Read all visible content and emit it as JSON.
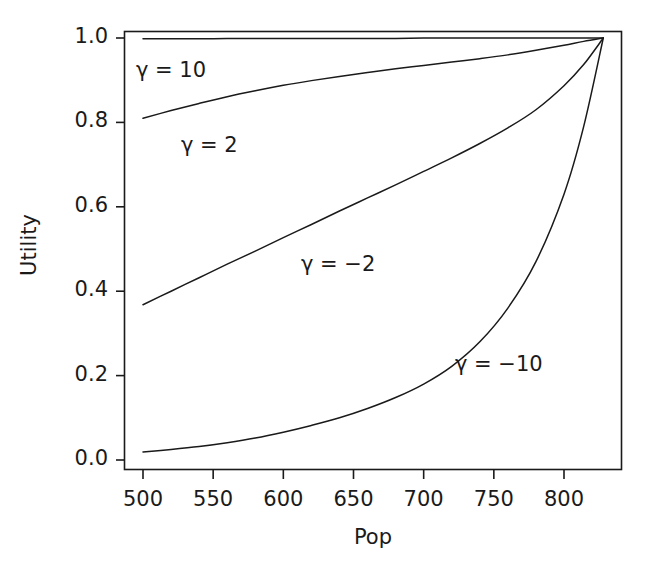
{
  "chart_data": {
    "type": "line",
    "title": "",
    "xlabel": "Pop",
    "ylabel": "Utility",
    "xlim": [
      500,
      828
    ],
    "ylim": [
      0.0,
      1.02
    ],
    "grid": false,
    "legend_position": "inline-annotations",
    "xticks": [
      500,
      550,
      600,
      650,
      700,
      750,
      800
    ],
    "xtick_labels": [
      "500",
      "550",
      "600",
      "650",
      "700",
      "750",
      "800"
    ],
    "yticks": [
      0.0,
      0.2,
      0.4,
      0.6,
      0.8,
      1.0
    ],
    "ytick_labels": [
      "0.0",
      "0.2",
      "0.4",
      "0.6",
      "0.8",
      "1.0"
    ],
    "x": [
      500,
      520,
      540,
      560,
      580,
      600,
      620,
      640,
      660,
      680,
      700,
      720,
      740,
      760,
      780,
      800,
      814,
      828
    ],
    "series": [
      {
        "name": "gamma = 10",
        "label": "γ = 10",
        "gamma": 10,
        "color": "#1a1a1a",
        "values": [
          0.998,
          0.998,
          0.998,
          0.999,
          0.999,
          0.999,
          0.999,
          0.999,
          0.999,
          0.999,
          1.0,
          1.0,
          1.0,
          1.0,
          1.0,
          1.0,
          1.0,
          1.0
        ]
      },
      {
        "name": "gamma = 2",
        "label": "γ = 2",
        "gamma": 2,
        "color": "#1a1a1a",
        "values": [
          0.81,
          0.828,
          0.845,
          0.861,
          0.875,
          0.888,
          0.899,
          0.909,
          0.918,
          0.927,
          0.935,
          0.943,
          0.951,
          0.96,
          0.971,
          0.983,
          0.992,
          1.0
        ]
      },
      {
        "name": "gamma = -2",
        "label": "γ = −2",
        "gamma": -2,
        "color": "#1a1a1a",
        "values": [
          0.368,
          0.4,
          0.432,
          0.464,
          0.495,
          0.527,
          0.558,
          0.59,
          0.621,
          0.652,
          0.684,
          0.716,
          0.75,
          0.787,
          0.83,
          0.887,
          0.937,
          1.0
        ]
      },
      {
        "name": "gamma = -10",
        "label": "γ = −10",
        "gamma": -10,
        "color": "#1a1a1a",
        "values": [
          0.019,
          0.025,
          0.032,
          0.041,
          0.052,
          0.066,
          0.082,
          0.1,
          0.122,
          0.148,
          0.18,
          0.222,
          0.28,
          0.36,
          0.47,
          0.63,
          0.79,
          1.0
        ]
      }
    ],
    "annotations": [
      {
        "text": "γ = 10",
        "x_px": 136,
        "y_px": 58
      },
      {
        "text": "γ = 2",
        "x_px": 181,
        "y_px": 133
      },
      {
        "text": "γ = −2",
        "x_px": 301,
        "y_px": 252
      },
      {
        "text": "γ = −10",
        "x_px": 455,
        "y_px": 352
      }
    ]
  },
  "axes": {
    "x_title": "Pop",
    "y_title": "Utility"
  }
}
